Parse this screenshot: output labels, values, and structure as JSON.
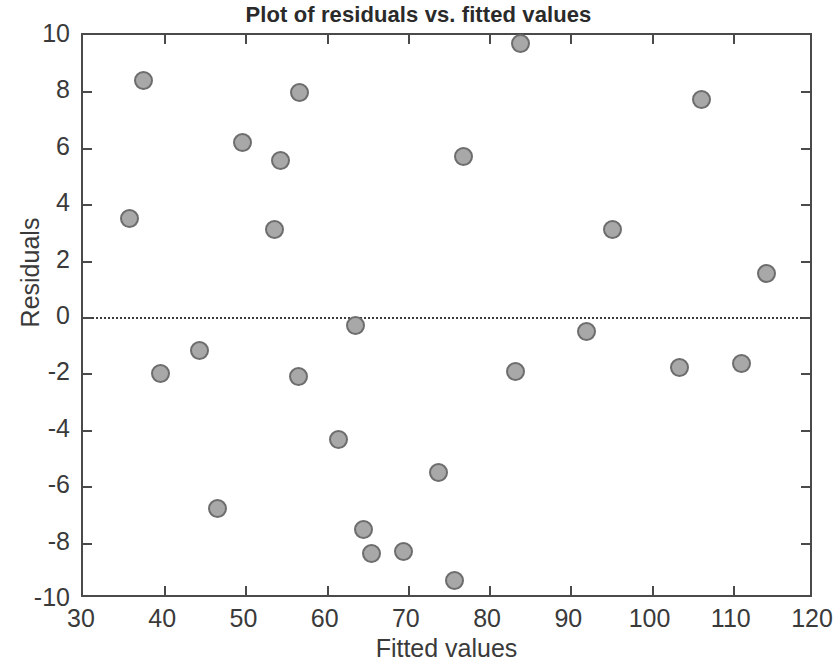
{
  "chart_data": {
    "type": "scatter",
    "title": "Plot of residuals vs. fitted values",
    "xlabel": "Fitted values",
    "ylabel": "Residuals",
    "xlim": [
      30,
      120
    ],
    "ylim": [
      -10,
      10
    ],
    "xticks": [
      30,
      40,
      50,
      60,
      70,
      80,
      90,
      100,
      110,
      120
    ],
    "yticks": [
      -10,
      -8,
      -6,
      -4,
      -2,
      0,
      2,
      4,
      6,
      8,
      10
    ],
    "xtick_labels": [
      "30",
      "40",
      "50",
      "60",
      "70",
      "80",
      "90",
      "100",
      "110",
      "120"
    ],
    "ytick_labels": [
      "-10",
      "-8",
      "-6",
      "-4",
      "-2",
      "0",
      "2",
      "4",
      "6",
      "8",
      "10"
    ],
    "grid": false,
    "legend": null,
    "reference_lines": [
      {
        "name": "zero-residual-line",
        "orientation": "horizontal",
        "y": 0,
        "style": "dotted",
        "color": "#3c3c3c"
      }
    ],
    "marker_style": {
      "shape": "circle",
      "fill_color": "#a8a8a8",
      "edge_color": "#6d6d6d",
      "size_px": 19
    },
    "series": [
      {
        "name": "residuals",
        "points": [
          {
            "x": 35.7,
            "y": 3.5
          },
          {
            "x": 37.5,
            "y": 8.4
          },
          {
            "x": 39.5,
            "y": -2.0
          },
          {
            "x": 44.4,
            "y": -1.2
          },
          {
            "x": 46.6,
            "y": -6.8
          },
          {
            "x": 49.6,
            "y": 6.2
          },
          {
            "x": 53.6,
            "y": 3.1
          },
          {
            "x": 54.3,
            "y": 5.55
          },
          {
            "x": 56.5,
            "y": -2.1
          },
          {
            "x": 56.6,
            "y": 7.95
          },
          {
            "x": 61.5,
            "y": -4.35
          },
          {
            "x": 63.6,
            "y": -0.3
          },
          {
            "x": 64.5,
            "y": -7.55
          },
          {
            "x": 65.5,
            "y": -8.4
          },
          {
            "x": 69.5,
            "y": -8.3
          },
          {
            "x": 73.8,
            "y": -5.5
          },
          {
            "x": 75.7,
            "y": -9.35
          },
          {
            "x": 76.8,
            "y": 5.7
          },
          {
            "x": 83.3,
            "y": -1.95
          },
          {
            "x": 83.9,
            "y": 9.7
          },
          {
            "x": 92.0,
            "y": -0.5
          },
          {
            "x": 95.2,
            "y": 3.1
          },
          {
            "x": 103.4,
            "y": -1.8
          },
          {
            "x": 106.1,
            "y": 7.7
          },
          {
            "x": 111.1,
            "y": -1.65
          },
          {
            "x": 114.1,
            "y": 1.55
          }
        ]
      }
    ]
  }
}
